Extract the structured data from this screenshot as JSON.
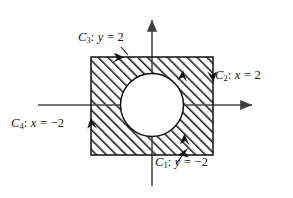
{
  "figure": {
    "background_color": "#ffffff",
    "ink_color": "#111111",
    "axis_color": "#4a4a4a",
    "hatch_color": "#1a1a1a",
    "axes": {
      "x_axis_name": "x-axis",
      "y_axis_name": "y-axis",
      "x_axis_arrow": "right-arrow",
      "y_axis_arrow": "up-arrow"
    },
    "region": {
      "shape": "square",
      "x_min": -2,
      "x_max": 2,
      "y_min": -2,
      "y_max": 2,
      "fill": "diagonal-hatching"
    },
    "hole": {
      "shape": "circle",
      "center_x": 0,
      "center_y": 0,
      "radius": 1.05,
      "fill": "white"
    },
    "labels": {
      "c1": {
        "name": "C",
        "subscript": "1",
        "separator": ":",
        "variable": "y",
        "equals": "=",
        "value": "−2"
      },
      "c2": {
        "name": "C",
        "subscript": "2",
        "separator": ":",
        "variable": "x",
        "equals": "=",
        "value": "2"
      },
      "c3": {
        "name": "C",
        "subscript": "3",
        "separator": ":",
        "variable": "y",
        "equals": "=",
        "value": "2"
      },
      "c4": {
        "name": "C",
        "subscript": "4",
        "separator": ":",
        "variable": "x",
        "equals": "=",
        "value": "−2"
      }
    },
    "orientation_arrows": [
      {
        "name": "top-edge-arrow",
        "edge": "C3",
        "direction": "left"
      },
      {
        "name": "left-edge-arrow",
        "edge": "C4",
        "direction": "down"
      },
      {
        "name": "bottom-edge-arrow",
        "edge": "C1",
        "direction": "right"
      },
      {
        "name": "right-edge-arrow",
        "edge": "C2",
        "direction": "up"
      },
      {
        "name": "circle-upper-arrow",
        "edge": "inner-circle",
        "direction": "up"
      },
      {
        "name": "circle-lower-arrow",
        "edge": "inner-circle",
        "direction": "down"
      }
    ]
  }
}
